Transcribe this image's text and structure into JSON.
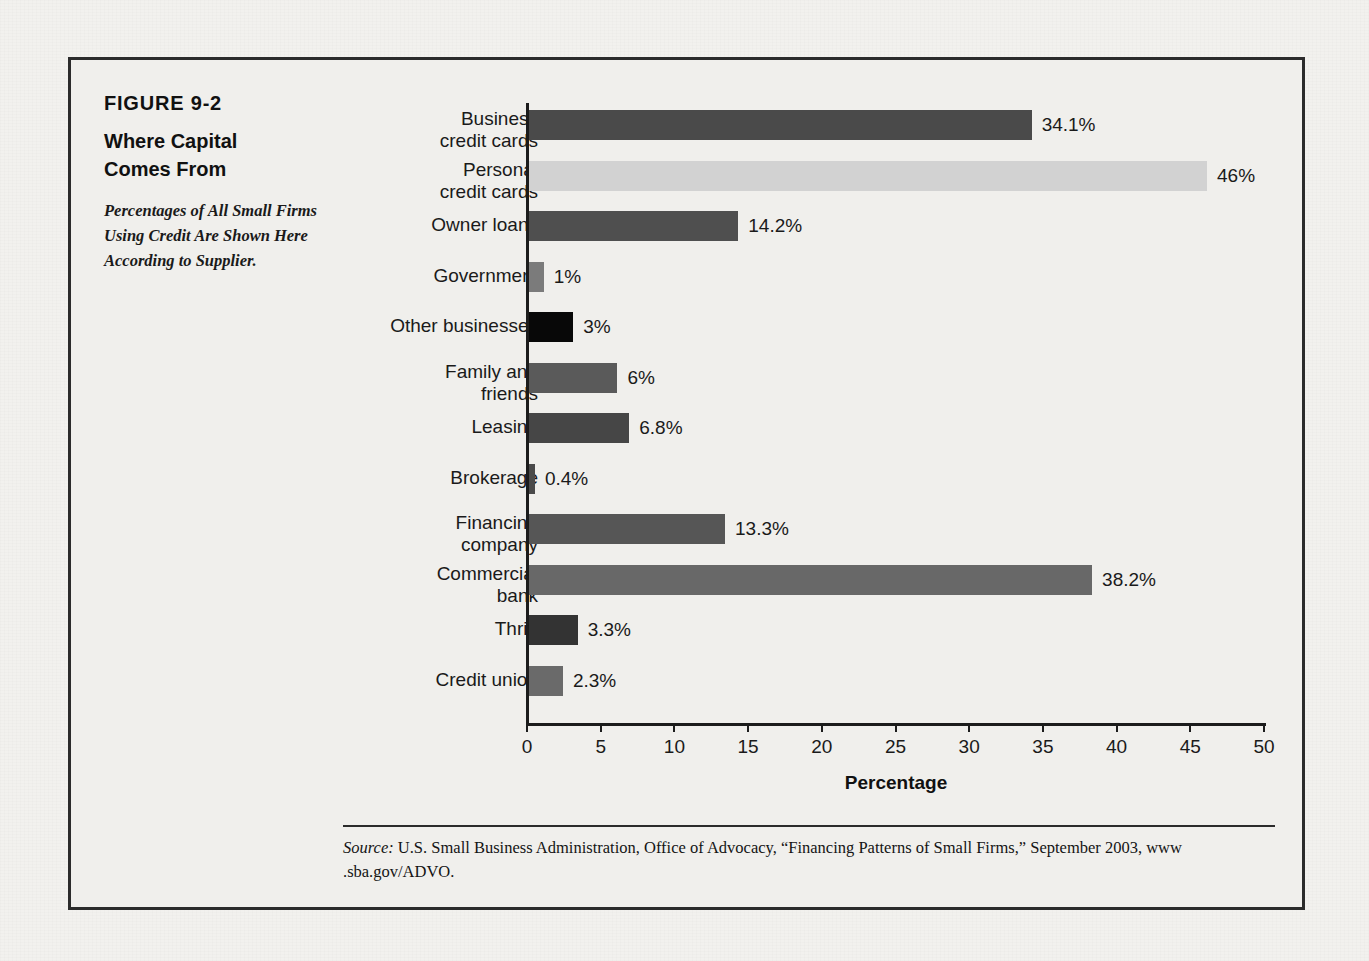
{
  "figure": {
    "number": "FIGURE 9-2",
    "title_line1": "Where Capital",
    "title_line2": "Comes From",
    "subtitle": "Percentages of All Small Firms Using Credit Are Shown Here According to Supplier."
  },
  "source": {
    "label": "Source:",
    "text": " U.S. Small Business Administration, Office of Advocacy, “Financing Patterns of Small Firms,” September 2003, www .sba.gov/ADVO."
  },
  "chart_data": {
    "type": "bar",
    "orientation": "horizontal",
    "title": "Where Capital Comes From",
    "xlabel": "Percentage",
    "ylabel": "",
    "xlim": [
      0,
      50
    ],
    "xticks": [
      0,
      5,
      10,
      15,
      20,
      25,
      30,
      35,
      40,
      45,
      50
    ],
    "xtick_labels": [
      "0",
      "5",
      "10",
      "15",
      "20",
      "25",
      "30",
      "35",
      "40",
      "45",
      "50"
    ],
    "grid": false,
    "legend": "none",
    "categories": [
      "Business credit cards",
      "Personal credit cards",
      "Owner loans",
      "Government",
      "Other businesses",
      "Family and friends",
      "Leasing",
      "Brokerage",
      "Financing company",
      "Commercial bank",
      "Thrift",
      "Credit union"
    ],
    "values": [
      34.1,
      46,
      14.2,
      1,
      3,
      6,
      6.8,
      0.4,
      13.3,
      38.2,
      3.3,
      2.3
    ],
    "value_labels": [
      "34.1%",
      "46%",
      "14.2%",
      "1%",
      "3%",
      "6%",
      "6.8%",
      "0.4%",
      "13.3%",
      "38.2%",
      "3.3%",
      "2.3%"
    ],
    "bar_colors": [
      "#4a4a4a",
      "#d2d2d2",
      "#4f4f4f",
      "#7b7b7b",
      "#080808",
      "#5a5a5a",
      "#464646",
      "#4a4a4a",
      "#565656",
      "#686868",
      "#333333",
      "#6a6a6a"
    ]
  },
  "bars": [
    {
      "label_line1": "Business",
      "label_line2": "credit cards",
      "value_label": "34.1%"
    },
    {
      "label_line1": "Personal",
      "label_line2": "credit cards",
      "value_label": "46%"
    },
    {
      "label_line1": "Owner loans",
      "label_line2": "",
      "value_label": "14.2%"
    },
    {
      "label_line1": "Government",
      "label_line2": "",
      "value_label": "1%"
    },
    {
      "label_line1": "Other businesses",
      "label_line2": "",
      "value_label": "3%"
    },
    {
      "label_line1": "Family and",
      "label_line2": "friends",
      "value_label": "6%"
    },
    {
      "label_line1": "Leasing",
      "label_line2": "",
      "value_label": "6.8%"
    },
    {
      "label_line1": "Brokerage",
      "label_line2": "",
      "value_label": "0.4%"
    },
    {
      "label_line1": "Financing",
      "label_line2": "company",
      "value_label": "13.3%"
    },
    {
      "label_line1": "Commercial",
      "label_line2": "bank",
      "value_label": "38.2%"
    },
    {
      "label_line1": "Thrift",
      "label_line2": "",
      "value_label": "3.3%"
    },
    {
      "label_line1": "Credit union",
      "label_line2": "",
      "value_label": "2.3%"
    }
  ]
}
